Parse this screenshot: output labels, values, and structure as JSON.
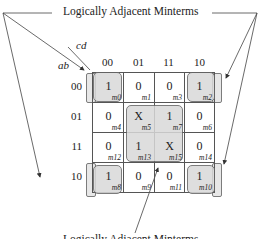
{
  "diagram": {
    "type": "karnaugh-map",
    "top_label": "Logically Adjacent Minterms",
    "bottom_label": "Logically Adjacent Minterms",
    "column_variable": "cd",
    "row_variable": "ab",
    "column_headers": [
      "00",
      "01",
      "11",
      "10"
    ],
    "row_headers": [
      "00",
      "01",
      "11",
      "10"
    ],
    "rows": [
      [
        {
          "value": "1",
          "minterm": "m0"
        },
        {
          "value": "0",
          "minterm": "m1"
        },
        {
          "value": "0",
          "minterm": "m3"
        },
        {
          "value": "1",
          "minterm": "m2"
        }
      ],
      [
        {
          "value": "0",
          "minterm": "m4"
        },
        {
          "value": "X",
          "minterm": "m5"
        },
        {
          "value": "1",
          "minterm": "m7"
        },
        {
          "value": "0",
          "minterm": "m6"
        }
      ],
      [
        {
          "value": "0",
          "minterm": "m12"
        },
        {
          "value": "1",
          "minterm": "m13"
        },
        {
          "value": "X",
          "minterm": "m15"
        },
        {
          "value": "0",
          "minterm": "m14"
        }
      ],
      [
        {
          "value": "1",
          "minterm": "m8"
        },
        {
          "value": "0",
          "minterm": "m9"
        },
        {
          "value": "0",
          "minterm": "m11"
        },
        {
          "value": "1",
          "minterm": "m10"
        }
      ]
    ],
    "groups": [
      {
        "name": "corners",
        "minterms": [
          "m0",
          "m2",
          "m8",
          "m10"
        ]
      },
      {
        "name": "center",
        "minterms": [
          "m5",
          "m7",
          "m13",
          "m15"
        ]
      }
    ],
    "colors": {
      "shade": "#d9d9d9",
      "line": "#555555"
    }
  }
}
